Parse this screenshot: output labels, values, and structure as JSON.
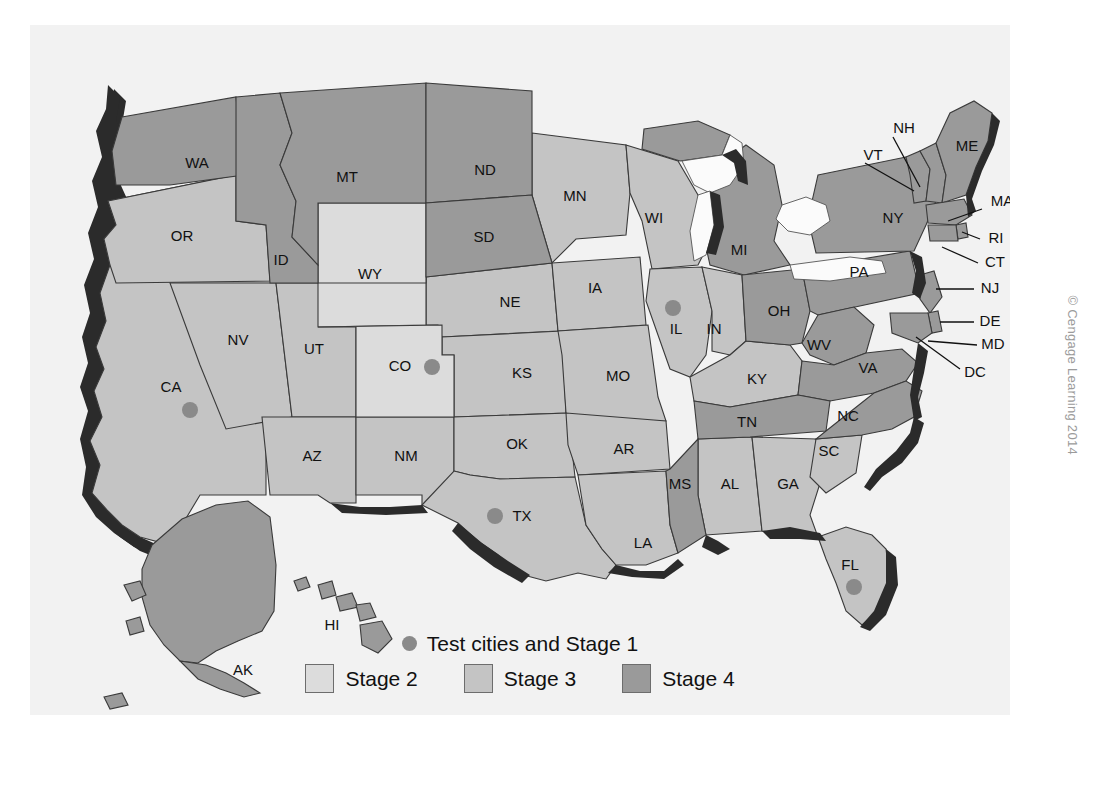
{
  "figure": {
    "title_cut_off": "",
    "copyright": "© Cengage Learning 2014"
  },
  "legend": {
    "test_cities_label": "Test cities and Stage 1",
    "test_city_dot_color": "#8a8a8a",
    "items": [
      {
        "label": "Stage 2",
        "color": "#dcdcdc"
      },
      {
        "label": "Stage 3",
        "color": "#c4c4c4"
      },
      {
        "label": "Stage 4",
        "color": "#9a9a9a"
      }
    ]
  },
  "map": {
    "background": "#f2f2f2",
    "coast_shadow_color": "#2b2b2b",
    "states": [
      {
        "code": "WA",
        "stage": 4,
        "label_x": 167,
        "label_y": 139
      },
      {
        "code": "OR",
        "stage": 3,
        "label_x": 152,
        "label_y": 212
      },
      {
        "code": "CA",
        "stage": 3,
        "label_x": 141,
        "label_y": 363
      },
      {
        "code": "ID",
        "stage": 4,
        "label_x": 251,
        "label_y": 236
      },
      {
        "code": "NV",
        "stage": 3,
        "label_x": 208,
        "label_y": 316
      },
      {
        "code": "UT",
        "stage": 3,
        "label_x": 284,
        "label_y": 325
      },
      {
        "code": "AZ",
        "stage": 3,
        "label_x": 282,
        "label_y": 432
      },
      {
        "code": "MT",
        "stage": 4,
        "label_x": 317,
        "label_y": 153
      },
      {
        "code": "WY",
        "stage": 2,
        "label_x": 340,
        "label_y": 250
      },
      {
        "code": "CO",
        "stage": 2,
        "label_x": 370,
        "label_y": 342
      },
      {
        "code": "NM",
        "stage": 3,
        "label_x": 376,
        "label_y": 432
      },
      {
        "code": "ND",
        "stage": 4,
        "label_x": 455,
        "label_y": 146
      },
      {
        "code": "SD",
        "stage": 4,
        "label_x": 454,
        "label_y": 213
      },
      {
        "code": "NE",
        "stage": 3,
        "label_x": 480,
        "label_y": 278
      },
      {
        "code": "KS",
        "stage": 3,
        "label_x": 492,
        "label_y": 349
      },
      {
        "code": "OK",
        "stage": 3,
        "label_x": 487,
        "label_y": 420
      },
      {
        "code": "TX",
        "stage": 3,
        "label_x": 492,
        "label_y": 492
      },
      {
        "code": "MN",
        "stage": 3,
        "label_x": 545,
        "label_y": 172
      },
      {
        "code": "IA",
        "stage": 3,
        "label_x": 565,
        "label_y": 264
      },
      {
        "code": "MO",
        "stage": 3,
        "label_x": 588,
        "label_y": 352
      },
      {
        "code": "AR",
        "stage": 3,
        "label_x": 594,
        "label_y": 425
      },
      {
        "code": "LA",
        "stage": 3,
        "label_x": 613,
        "label_y": 519
      },
      {
        "code": "WI",
        "stage": 3,
        "label_x": 624,
        "label_y": 194
      },
      {
        "code": "IL",
        "stage": 3,
        "label_x": 646,
        "label_y": 305
      },
      {
        "code": "MS",
        "stage": 4,
        "label_x": 650,
        "label_y": 460
      },
      {
        "code": "MI",
        "stage": 4,
        "label_x": 709,
        "label_y": 226
      },
      {
        "code": "IN",
        "stage": 3,
        "label_x": 684,
        "label_y": 305
      },
      {
        "code": "KY",
        "stage": 3,
        "label_x": 727,
        "label_y": 355
      },
      {
        "code": "TN",
        "stage": 4,
        "label_x": 717,
        "label_y": 398
      },
      {
        "code": "AL",
        "stage": 3,
        "label_x": 700,
        "label_y": 460
      },
      {
        "code": "GA",
        "stage": 3,
        "label_x": 758,
        "label_y": 460
      },
      {
        "code": "FL",
        "stage": 3,
        "label_x": 820,
        "label_y": 541
      },
      {
        "code": "SC",
        "stage": 3,
        "label_x": 799,
        "label_y": 427
      },
      {
        "code": "NC",
        "stage": 4,
        "label_x": 818,
        "label_y": 392
      },
      {
        "code": "OH",
        "stage": 4,
        "label_x": 749,
        "label_y": 287
      },
      {
        "code": "WV",
        "stage": 4,
        "label_x": 789,
        "label_y": 321
      },
      {
        "code": "VA",
        "stage": 4,
        "label_x": 838,
        "label_y": 344
      },
      {
        "code": "PA",
        "stage": 4,
        "label_x": 829,
        "label_y": 248
      },
      {
        "code": "NY",
        "stage": 4,
        "label_x": 863,
        "label_y": 194
      },
      {
        "code": "ME",
        "stage": 4,
        "label_x": 937,
        "label_y": 122
      },
      {
        "code": "VT",
        "stage": 4,
        "label_x": 843,
        "label_y": 131
      },
      {
        "code": "NH",
        "stage": 4,
        "label_x": 874,
        "label_y": 104
      },
      {
        "code": "MA",
        "stage": 4,
        "label_x": 972,
        "label_y": 177
      },
      {
        "code": "RI",
        "stage": 4,
        "label_x": 966,
        "label_y": 214
      },
      {
        "code": "CT",
        "stage": 4,
        "label_x": 965,
        "label_y": 238
      },
      {
        "code": "NJ",
        "stage": 4,
        "label_x": 960,
        "label_y": 264
      },
      {
        "code": "DE",
        "stage": 4,
        "label_x": 960,
        "label_y": 297
      },
      {
        "code": "MD",
        "stage": 4,
        "label_x": 963,
        "label_y": 320
      },
      {
        "code": "DC",
        "stage": 4,
        "label_x": 945,
        "label_y": 348
      },
      {
        "code": "AK",
        "stage": 4,
        "label_x": 213,
        "label_y": 646
      },
      {
        "code": "HI",
        "stage": 4,
        "label_x": 302,
        "label_y": 601
      }
    ],
    "test_cities": [
      {
        "state": "CA",
        "x": 160,
        "y": 385
      },
      {
        "state": "CO",
        "x": 402,
        "y": 342
      },
      {
        "state": "TX",
        "x": 465,
        "y": 491
      },
      {
        "state": "IL",
        "x": 643,
        "y": 283
      },
      {
        "state": "FL",
        "x": 824,
        "y": 562
      }
    ]
  }
}
